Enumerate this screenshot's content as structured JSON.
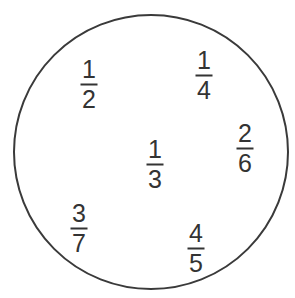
{
  "canvas": {
    "width": 295,
    "height": 298,
    "background_color": "#ffffff"
  },
  "set_circle": {
    "name": "set-boundary-circle",
    "center_x": 151,
    "center_y": 152,
    "radius": 137,
    "stroke_color": "#3a3a3a",
    "stroke_width": 2,
    "fill": "none",
    "clipped_at_bottom": true
  },
  "elements": [
    {
      "id": "fraction-one-half",
      "numerator": "1",
      "denominator": "2",
      "value_text": "1/2",
      "x": 89,
      "y": 84,
      "font_size": 25,
      "color": "#333333"
    },
    {
      "id": "fraction-one-quarter",
      "numerator": "1",
      "denominator": "4",
      "value_text": "1/4",
      "x": 204,
      "y": 75,
      "font_size": 25,
      "color": "#333333"
    },
    {
      "id": "fraction-two-sixths",
      "numerator": "2",
      "denominator": "6",
      "value_text": "2/6",
      "x": 245,
      "y": 148,
      "font_size": 25,
      "color": "#333333"
    },
    {
      "id": "fraction-one-third",
      "numerator": "1",
      "denominator": "3",
      "value_text": "1/3",
      "x": 155,
      "y": 164,
      "font_size": 25,
      "color": "#333333"
    },
    {
      "id": "fraction-three-sevenths",
      "numerator": "3",
      "denominator": "7",
      "value_text": "3/7",
      "x": 79,
      "y": 228,
      "font_size": 25,
      "color": "#333333"
    },
    {
      "id": "fraction-four-fifths",
      "numerator": "4",
      "denominator": "5",
      "value_text": "4/5",
      "x": 196,
      "y": 248,
      "font_size": 25,
      "color": "#333333"
    }
  ]
}
